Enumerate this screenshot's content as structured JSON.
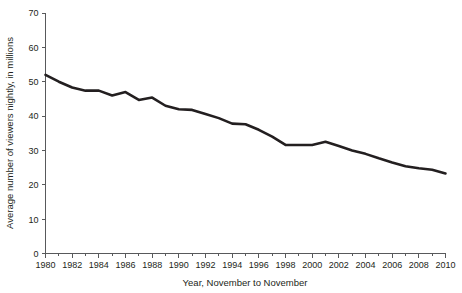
{
  "chart_data": {
    "type": "line",
    "title": "",
    "xlabel": "Year, November to November",
    "ylabel": "Average number of viewers nightly, in millions",
    "xlim": [
      1980,
      2010
    ],
    "ylim": [
      0,
      70
    ],
    "ytick_step": 10,
    "xtick_step": 2,
    "x_minor_tick_step": 1,
    "grid": false,
    "legend": "none",
    "line_color": "#231f20",
    "axis_color": "#58595b",
    "x": [
      1980,
      1981,
      1982,
      1983,
      1984,
      1985,
      1986,
      1987,
      1988,
      1989,
      1990,
      1991,
      1992,
      1993,
      1994,
      1995,
      1996,
      1997,
      1998,
      1999,
      2000,
      2001,
      2002,
      2003,
      2004,
      2005,
      2006,
      2007,
      2008,
      2009,
      2010
    ],
    "values": [
      52.0,
      50.0,
      48.3,
      47.4,
      47.4,
      46.0,
      47.0,
      44.7,
      45.4,
      43.0,
      42.0,
      41.8,
      40.6,
      39.4,
      37.8,
      37.6,
      36.0,
      34.0,
      31.6,
      31.6,
      31.6,
      32.5,
      31.3,
      30.0,
      29.0,
      27.7,
      26.5,
      25.4,
      24.8,
      24.4,
      23.3
    ],
    "y_ticks": [
      0,
      10,
      20,
      30,
      40,
      50,
      60,
      70
    ],
    "x_ticks": [
      1980,
      1982,
      1984,
      1986,
      1988,
      1990,
      1992,
      1994,
      1996,
      1998,
      2000,
      2002,
      2004,
      2006,
      2008,
      2010
    ],
    "y_tick_labels": [
      "0",
      "10",
      "20",
      "30",
      "40",
      "50",
      "60",
      "70"
    ],
    "x_tick_labels": [
      "1980",
      "1982",
      "1984",
      "1986",
      "1988",
      "1990",
      "1992",
      "1994",
      "1996",
      "1998",
      "2000",
      "2002",
      "2004",
      "2006",
      "2008",
      "2010"
    ]
  }
}
